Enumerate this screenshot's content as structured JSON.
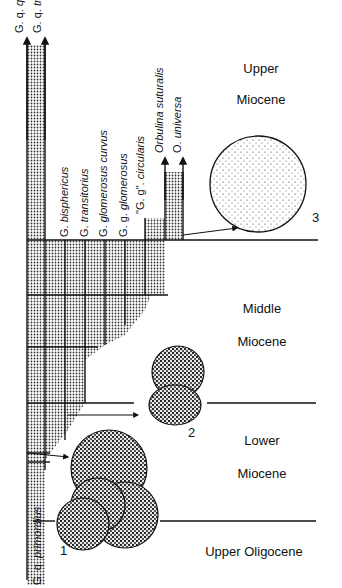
{
  "diagram": {
    "species": [
      {
        "id": "qq",
        "label_abbr": "G. q.",
        "label": "quadrilobatus"
      },
      {
        "id": "qt",
        "label_abbr": "G. q.",
        "label": "trilobus"
      },
      {
        "id": "bis",
        "label_abbr": "G.",
        "label": "bisphericus"
      },
      {
        "id": "tra",
        "label_abbr": "G.",
        "label": "transitorius"
      },
      {
        "id": "glc",
        "label_abbr": "G.",
        "label": "glomerosus curvus"
      },
      {
        "id": "ggg",
        "label_abbr": "G. g.",
        "label": "glomerosus"
      },
      {
        "id": "ggc",
        "label_abbr": "\"G. g\".",
        "label": "circularis"
      },
      {
        "id": "orb",
        "label_abbr": "",
        "label": "Orbulina suturalis"
      },
      {
        "id": "ouni",
        "label_abbr": "O.",
        "label": "universa"
      },
      {
        "id": "prim",
        "label_abbr": "G. q.",
        "label": "primordius"
      }
    ],
    "epochs": [
      {
        "id": "upper-miocene",
        "line1": "Upper",
        "line2": "Miocene"
      },
      {
        "id": "middle-miocene",
        "line1": "Middle",
        "line2": "Miocene"
      },
      {
        "id": "lower-miocene",
        "line1": "Lower",
        "line2": "Miocene"
      },
      {
        "id": "upper-oligocene",
        "line1": "Upper Oligocene",
        "line2": ""
      }
    ],
    "specimens": [
      {
        "id": "specimen-1",
        "number": "1"
      },
      {
        "id": "specimen-2",
        "number": "2"
      },
      {
        "id": "specimen-3",
        "number": "3"
      }
    ]
  }
}
